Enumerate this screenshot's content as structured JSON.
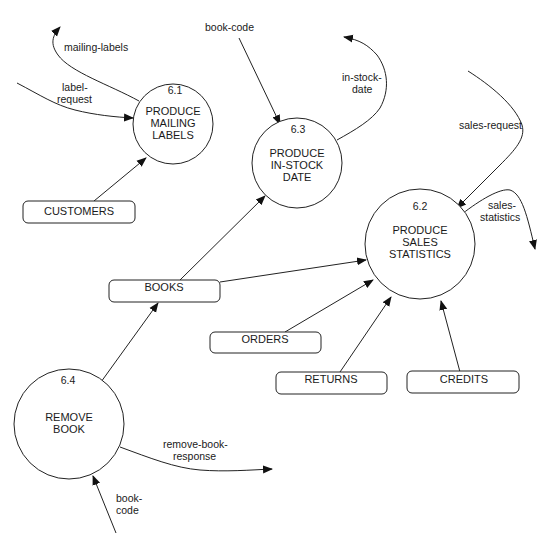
{
  "diagram": {
    "type": "data-flow-diagram",
    "processes": [
      {
        "id": "6.1",
        "number": "6.1",
        "lines": [
          "PRODUCE",
          "MAILING",
          "LABELS"
        ]
      },
      {
        "id": "6.2",
        "number": "6.2",
        "lines": [
          "PRODUCE",
          "SALES",
          "STATISTICS"
        ]
      },
      {
        "id": "6.3",
        "number": "6.3",
        "lines": [
          "PRODUCE",
          "IN-STOCK",
          "DATE"
        ]
      },
      {
        "id": "6.4",
        "number": "6.4",
        "lines": [
          "REMOVE",
          "BOOK"
        ]
      }
    ],
    "data_stores": [
      {
        "id": "customers",
        "label": "CUSTOMERS"
      },
      {
        "id": "books",
        "label": "BOOKS"
      },
      {
        "id": "orders",
        "label": "ORDERS"
      },
      {
        "id": "returns",
        "label": "RETURNS"
      },
      {
        "id": "credits",
        "label": "CREDITS"
      }
    ],
    "flows": [
      {
        "id": "mailing-labels",
        "label_lines": [
          "mailing-labels"
        ],
        "from": "6.1",
        "to": "external"
      },
      {
        "id": "label-request",
        "label_lines": [
          "label-",
          "request"
        ],
        "from": "external",
        "to": "6.1"
      },
      {
        "id": "customers-to-6.1",
        "label_lines": [],
        "from": "customers",
        "to": "6.1"
      },
      {
        "id": "book-code-6.3",
        "label_lines": [
          "book-code"
        ],
        "from": "external",
        "to": "6.3"
      },
      {
        "id": "in-stock-date",
        "label_lines": [
          "in-stock-",
          "date"
        ],
        "from": "6.3",
        "to": "external"
      },
      {
        "id": "books-to-6.3",
        "label_lines": [],
        "from": "books",
        "to": "6.3"
      },
      {
        "id": "sales-request",
        "label_lines": [
          "sales-request"
        ],
        "from": "external",
        "to": "6.2"
      },
      {
        "id": "sales-statistics",
        "label_lines": [
          "sales-",
          "statistics"
        ],
        "from": "6.2",
        "to": "external"
      },
      {
        "id": "books-to-6.2",
        "label_lines": [],
        "from": "books",
        "to": "6.2"
      },
      {
        "id": "orders-to-6.2",
        "label_lines": [],
        "from": "orders",
        "to": "6.2"
      },
      {
        "id": "returns-to-6.2",
        "label_lines": [],
        "from": "returns",
        "to": "6.2"
      },
      {
        "id": "credits-to-6.2",
        "label_lines": [],
        "from": "credits",
        "to": "6.2"
      },
      {
        "id": "6.4-to-books",
        "label_lines": [],
        "from": "6.4",
        "to": "books"
      },
      {
        "id": "remove-book-response",
        "label_lines": [
          "remove-book-",
          "response"
        ],
        "from": "6.4",
        "to": "external"
      },
      {
        "id": "book-code-6.4",
        "label_lines": [
          "book-",
          "code"
        ],
        "from": "external",
        "to": "6.4"
      }
    ]
  }
}
